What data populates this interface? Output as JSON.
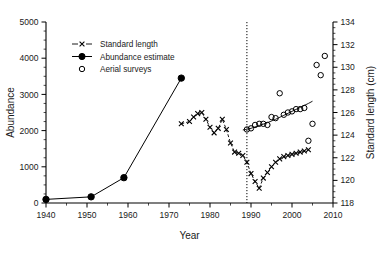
{
  "figure": {
    "background_color": "#ffffff",
    "foreground_color": "#000000"
  },
  "axes": {
    "x": {
      "title": "Year",
      "min": 1940,
      "max": 2010,
      "tick_labels": [
        "1940",
        "1950",
        "1960",
        "1970",
        "1980",
        "1990",
        "2000",
        "2010"
      ],
      "ticks": [
        1940,
        1950,
        1960,
        1970,
        1980,
        1990,
        2000,
        2010
      ],
      "minor_step": 5
    },
    "y_left": {
      "title": "Abundance",
      "min": 0,
      "max": 5000,
      "tick_labels": [
        "0",
        "1000",
        "2000",
        "3000",
        "4000",
        "5000"
      ],
      "ticks": [
        0,
        1000,
        2000,
        3000,
        4000,
        5000
      ],
      "minor_step": 250
    },
    "y_right": {
      "title": "Standard length (cm)",
      "min": 118,
      "max": 134,
      "tick_labels": [
        "118",
        "120",
        "122",
        "124",
        "126",
        "128",
        "130",
        "132",
        "134"
      ],
      "ticks": [
        118,
        120,
        122,
        124,
        126,
        128,
        130,
        132,
        134
      ],
      "minor_step": 0.5
    }
  },
  "legend": {
    "items": [
      {
        "label": "Standard length",
        "marker": "cross-dashed-line",
        "axis": "right"
      },
      {
        "label": "Abundance estimate",
        "marker": "filled-circle-solid-line",
        "axis": "left"
      },
      {
        "label": "Aerial surveys",
        "marker": "open-circle",
        "axis": "right"
      }
    ]
  },
  "annotations": {
    "divider_year": 1989,
    "divider_style": "dotted-vertical-line"
  },
  "chart_data": {
    "type": "line",
    "title": "",
    "xlabel": "Year",
    "ylabel": "Abundance",
    "ylabel_secondary": "Standard length (cm)",
    "xlim": [
      1940,
      2010
    ],
    "ylim": [
      0,
      5000
    ],
    "ylim_secondary": [
      118,
      134
    ],
    "grid": false,
    "legend_position": "upper-left-inside",
    "series": [
      {
        "name": "Abundance estimate",
        "axis": "left",
        "marker": "filled-circle",
        "linestyle": "solid",
        "x": [
          1940,
          1951,
          1959,
          1973
        ],
        "values": [
          100,
          170,
          700,
          3450
        ]
      },
      {
        "name": "Standard length",
        "axis": "right",
        "marker": "cross",
        "linestyle": "dashed",
        "x": [
          1973,
          1975,
          1976,
          1977,
          1978,
          1979,
          1980,
          1981,
          1982,
          1983,
          1984,
          1985,
          1986,
          1987,
          1988,
          1989,
          1990,
          1991,
          1992,
          1993,
          1994,
          1995,
          1996,
          1997,
          1998,
          1999,
          2000,
          2001,
          2002,
          2003,
          2004
        ],
        "values": [
          125.0,
          125.2,
          125.6,
          125.9,
          126.0,
          125.4,
          124.7,
          124.2,
          124.6,
          125.4,
          124.5,
          123.3,
          122.5,
          122.4,
          122.2,
          121.6,
          120.6,
          119.9,
          119.3,
          120.2,
          120.7,
          121.2,
          121.6,
          121.9,
          122.1,
          122.2,
          122.3,
          122.4,
          122.5,
          122.6,
          122.7
        ]
      },
      {
        "name": "Aerial surveys",
        "axis": "right",
        "marker": "open-circle",
        "linestyle": "none",
        "x": [
          1989,
          1990,
          1991,
          1992,
          1993,
          1994,
          1995,
          1996,
          1997,
          1998,
          1999,
          2000,
          2001,
          2002,
          2003,
          2004,
          2005,
          2006,
          2007,
          2008
        ],
        "values": [
          124.5,
          124.6,
          124.9,
          125.0,
          125.0,
          124.9,
          125.6,
          125.5,
          127.7,
          125.8,
          126.0,
          126.1,
          126.3,
          126.3,
          126.4,
          123.5,
          125.0,
          130.2,
          129.3,
          131.0
        ]
      },
      {
        "name": "Aerial survey trend",
        "axis": "right",
        "marker": "none",
        "linestyle": "solid-fit",
        "x": [
          1988,
          1990,
          1992,
          1994,
          1996,
          1998,
          2000,
          2002,
          2004,
          2005
        ],
        "values": [
          124.45,
          124.6,
          124.85,
          125.1,
          125.4,
          125.75,
          126.1,
          126.45,
          126.8,
          127.0
        ]
      }
    ]
  }
}
